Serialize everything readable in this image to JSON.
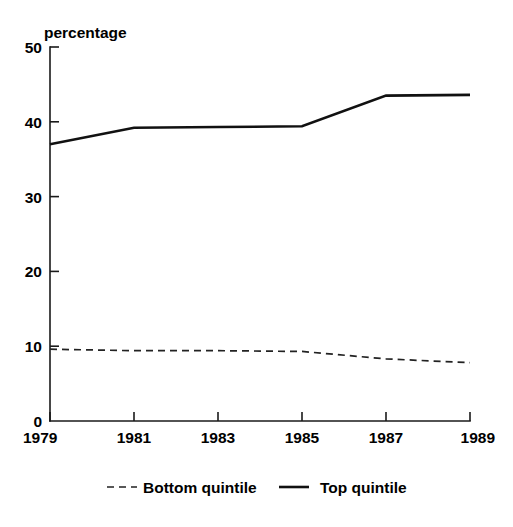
{
  "chart_data": {
    "type": "line",
    "title": "",
    "subtitle": "",
    "xlabel": "",
    "ylabel": "percentage",
    "x": [
      1979,
      1981,
      1983,
      1985,
      1987,
      1989
    ],
    "xtick_labels": [
      "1979",
      "1981",
      "1983",
      "1985",
      "1987",
      "1989"
    ],
    "ytick_labels": [
      "0",
      "10",
      "20",
      "30",
      "40",
      "50"
    ],
    "ytick_values": [
      0,
      10,
      20,
      30,
      40,
      50
    ],
    "xlim": [
      1979,
      1989
    ],
    "ylim": [
      0,
      50
    ],
    "grid": false,
    "legend_position": "bottom",
    "series": [
      {
        "name": "Bottom quintile",
        "style": "dashed",
        "color": "#222222",
        "values": [
          9.6,
          9.4,
          9.4,
          9.3,
          8.3,
          7.8
        ]
      },
      {
        "name": "Top quintile",
        "style": "solid",
        "color": "#111111",
        "values": [
          37.0,
          39.2,
          39.3,
          39.4,
          43.5,
          43.6
        ]
      }
    ]
  },
  "axes": {
    "y_axis_label": "percentage"
  },
  "legend": {
    "entries": [
      {
        "label": "Bottom quintile",
        "style": "dashed"
      },
      {
        "label": "Top quintile",
        "style": "solid"
      }
    ]
  }
}
